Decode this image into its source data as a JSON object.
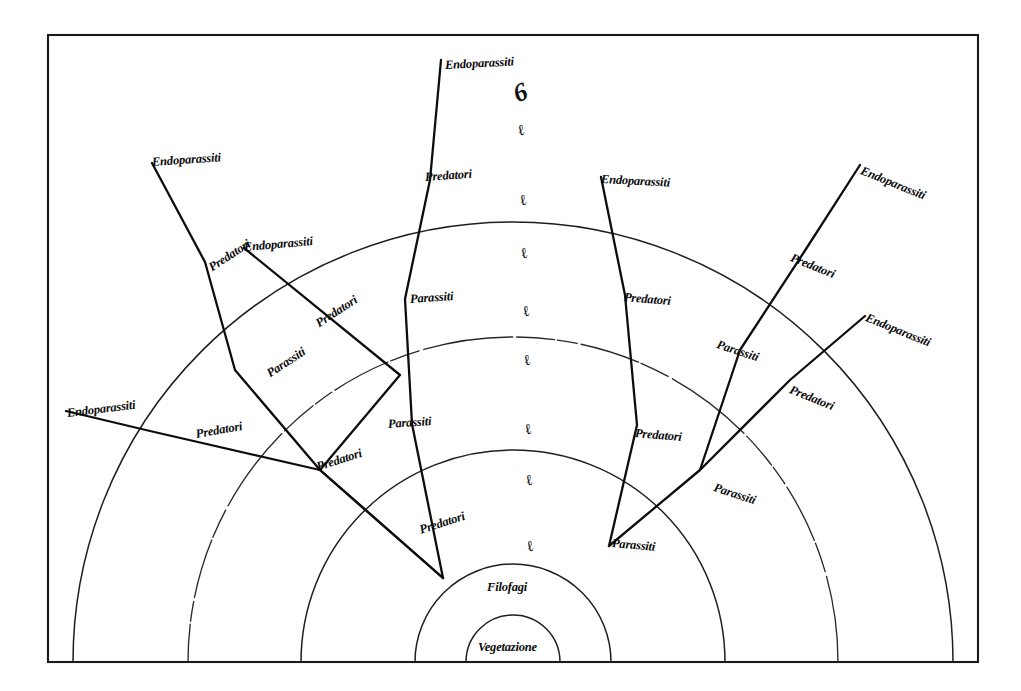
{
  "figure": {
    "language": "Italian",
    "background_color": "#ffffff",
    "ink_color": "#0d0d0d",
    "frame": {
      "x": 48,
      "y": 35,
      "width": 930,
      "height": 627
    }
  },
  "core_labels": [
    {
      "id": "vegetazione",
      "text": "Vegetazione",
      "x": 478,
      "y": 640,
      "rotate": 0
    },
    {
      "id": "filofagi",
      "text": "Filofagi",
      "x": 487,
      "y": 580,
      "rotate": 0
    }
  ],
  "ring_labels": [
    {
      "id": "predatori-1",
      "text": "Predatori",
      "x": 420,
      "y": 523,
      "rotate": -18
    },
    {
      "id": "predatori-2",
      "text": "Predatori",
      "x": 317,
      "y": 460,
      "rotate": -18
    },
    {
      "id": "predatori-3",
      "text": "Predatori",
      "x": 196,
      "y": 427,
      "rotate": -10
    },
    {
      "id": "endoparassiti-1",
      "text": "Endoparassiti",
      "x": 67,
      "y": 406,
      "rotate": -7
    },
    {
      "id": "parassiti-1",
      "text": "Parassiti",
      "x": 268,
      "y": 367,
      "rotate": -33
    },
    {
      "id": "predatori-4",
      "text": "Predatori",
      "x": 317,
      "y": 317,
      "rotate": -33
    },
    {
      "id": "predatori-5",
      "text": "Predatori",
      "x": 210,
      "y": 261,
      "rotate": -33
    },
    {
      "id": "endoparassiti-2",
      "text": "Endoparassiti",
      "x": 244,
      "y": 240,
      "rotate": -5
    },
    {
      "id": "endoparassiti-3",
      "text": "Endoparassiti",
      "x": 152,
      "y": 155,
      "rotate": -4
    },
    {
      "id": "parassiti-2",
      "text": "Parassiti",
      "x": 388,
      "y": 417,
      "rotate": -4
    },
    {
      "id": "parassiti-3",
      "text": "Parassiti",
      "x": 410,
      "y": 292,
      "rotate": -4
    },
    {
      "id": "predatori-6",
      "text": "Predatori",
      "x": 425,
      "y": 170,
      "rotate": -4
    },
    {
      "id": "endoparassiti-4",
      "text": "Endoparassiti",
      "x": 445,
      "y": 58,
      "rotate": -3
    },
    {
      "id": "parassiti-4",
      "text": "Parassiti",
      "x": 612,
      "y": 536,
      "rotate": 5
    },
    {
      "id": "predatori-7",
      "text": "Predatori",
      "x": 635,
      "y": 426,
      "rotate": 5
    },
    {
      "id": "predatori-8",
      "text": "Predatori",
      "x": 624,
      "y": 290,
      "rotate": 5
    },
    {
      "id": "endoparassiti-5",
      "text": "Endoparassiti",
      "x": 601,
      "y": 172,
      "rotate": 3
    },
    {
      "id": "parassiti-5",
      "text": "Parassiti",
      "x": 714,
      "y": 480,
      "rotate": 18
    },
    {
      "id": "parassiti-6",
      "text": "Parassiti",
      "x": 717,
      "y": 337,
      "rotate": 18
    },
    {
      "id": "predatori-9",
      "text": "Predatori",
      "x": 791,
      "y": 250,
      "rotate": 22
    },
    {
      "id": "endoparassiti-6",
      "text": "Endoparassiti",
      "x": 861,
      "y": 163,
      "rotate": 22
    },
    {
      "id": "predatori-10",
      "text": "Predatori",
      "x": 790,
      "y": 382,
      "rotate": 22
    },
    {
      "id": "endoparassiti-7",
      "text": "Endoparassiti",
      "x": 866,
      "y": 310,
      "rotate": 22
    }
  ],
  "axis_ticks": [
    {
      "id": "tick-0",
      "text": "6",
      "x": 514,
      "y": 78,
      "rotate": -22,
      "size": "top"
    },
    {
      "id": "tick-1",
      "text": "ℓ",
      "x": 518,
      "y": 122,
      "rotate": -22,
      "size": "normal"
    },
    {
      "id": "tick-2",
      "text": "ℓ",
      "x": 520,
      "y": 192,
      "rotate": -22,
      "size": "normal"
    },
    {
      "id": "tick-3",
      "text": "ℓ",
      "x": 521,
      "y": 245,
      "rotate": -22,
      "size": "normal"
    },
    {
      "id": "tick-4",
      "text": "ℓ",
      "x": 523,
      "y": 303,
      "rotate": -22,
      "size": "normal"
    },
    {
      "id": "tick-5",
      "text": "ℓ",
      "x": 524,
      "y": 352,
      "rotate": -22,
      "size": "normal"
    },
    {
      "id": "tick-6",
      "text": "ℓ",
      "x": 525,
      "y": 421,
      "rotate": -22,
      "size": "normal"
    },
    {
      "id": "tick-7",
      "text": "ℓ",
      "x": 526,
      "y": 472,
      "rotate": -22,
      "size": "normal"
    },
    {
      "id": "tick-8",
      "text": "ℓ",
      "x": 527,
      "y": 538,
      "rotate": -22,
      "size": "normal"
    }
  ],
  "chart_data": {
    "type": "diagram",
    "subtype": "concentric-trophic-web",
    "center": {
      "x": 513,
      "y": 662
    },
    "rings": [
      {
        "index": 0,
        "radius": 47,
        "label": "Vegetazione",
        "style": "solid"
      },
      {
        "index": 1,
        "radius": 98,
        "label": "Filofagi",
        "style": "solid"
      },
      {
        "index": 2,
        "radius": 212,
        "label": "Parassiti",
        "style": "solid"
      },
      {
        "index": 3,
        "radius": 325,
        "label": "Predatori",
        "style": "dashed"
      },
      {
        "index": 4,
        "radius": 440,
        "label": "Endoparassiti",
        "style": "solid"
      }
    ],
    "ring_sequence": [
      "Vegetazione",
      "Filofagi",
      "Parassiti",
      "Predatori",
      "Endoparassiti"
    ],
    "chain_count": 8,
    "chains": [
      {
        "id": "chain-a",
        "labels": [
          "Predatori",
          "Predatori",
          "Predatori",
          "Endoparassiti"
        ]
      },
      {
        "id": "chain-b",
        "labels": [
          "Predatori",
          "Parassiti",
          "Predatori",
          "Endoparassiti"
        ]
      },
      {
        "id": "chain-c",
        "labels": [
          "Predatori",
          "Parassiti",
          "Endoparassiti"
        ]
      },
      {
        "id": "chain-d",
        "labels": [
          "Parassiti",
          "Parassiti",
          "Predatori",
          "Endoparassiti"
        ]
      },
      {
        "id": "chain-e",
        "labels": [
          "Parassiti",
          "Predatori",
          "Predatori",
          "Endoparassiti"
        ]
      },
      {
        "id": "chain-f",
        "labels": [
          "Parassiti",
          "Parassiti",
          "Predatori",
          "Endoparassiti"
        ]
      },
      {
        "id": "chain-g",
        "labels": [
          "Parassiti",
          "Predatori",
          "Endoparassiti"
        ]
      }
    ],
    "grid": true,
    "legend": "none",
    "axis_tick_labels": [
      "6",
      "ℓ",
      "ℓ",
      "ℓ",
      "ℓ",
      "ℓ",
      "ℓ",
      "ℓ",
      "ℓ"
    ]
  }
}
